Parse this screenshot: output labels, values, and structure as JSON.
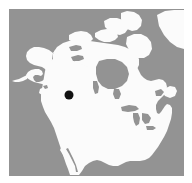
{
  "figure": {
    "type": "locator-map",
    "region": "North America",
    "background_color": "#ffffff",
    "ocean_color": "#939393",
    "land_color": "#fbfbfb",
    "marker_color": "#111111"
  },
  "map": {
    "frame": {
      "x": 9,
      "y": 9,
      "width": 175,
      "height": 167
    },
    "projection_note": "north-america-orthographic-like",
    "landmasses": [
      "mainland-north-america",
      "alaska",
      "canadian-arctic-archipelago",
      "greenland-west-edge",
      "newfoundland",
      "baja-california",
      "vancouver-island"
    ],
    "inland_waters": [
      "hudson-bay",
      "great-lakes",
      "great-slave-lake",
      "great-bear-lake",
      "lake-winnipeg",
      "gulf-of-california"
    ]
  },
  "marker": {
    "name": "location-marker",
    "shape": "filled-circle",
    "center_x": 69,
    "center_y": 95,
    "radius": 4.5,
    "color": "#111111"
  }
}
